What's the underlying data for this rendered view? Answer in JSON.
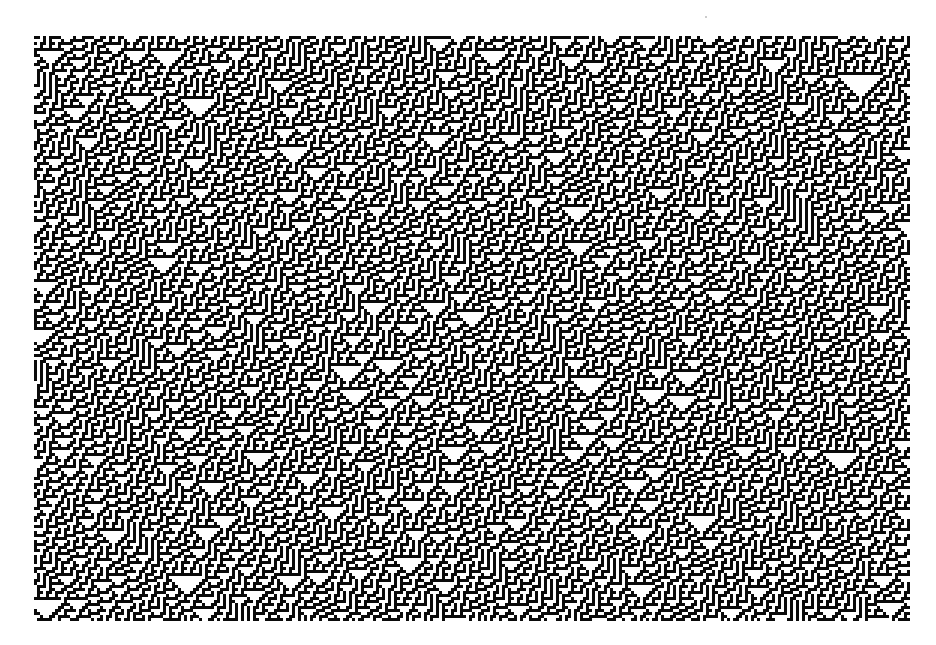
{
  "figure": {
    "rule": 30,
    "seed": 1983,
    "density": 0.5,
    "cell_size_px": 3,
    "region": {
      "left": 34,
      "top": 36,
      "width": 876,
      "height": 585
    },
    "colors": {
      "on": "#0a0a0a",
      "off": "#ffffff",
      "background": "#ffffff"
    }
  }
}
